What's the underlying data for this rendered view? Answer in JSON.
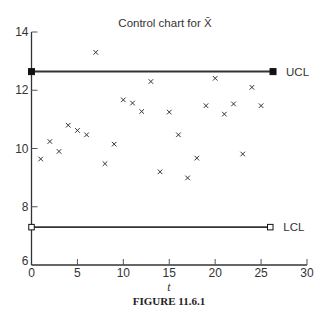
{
  "chart_data": {
    "type": "scatter",
    "title": "Control chart for X̄",
    "xlabel": "t",
    "ylabel": "",
    "caption": "FIGURE 11.6.1",
    "xlim": [
      0,
      30
    ],
    "ylim": [
      6,
      14
    ],
    "xticks": [
      0,
      5,
      10,
      15,
      20,
      25,
      30
    ],
    "yticks": [
      6,
      8,
      10,
      12,
      14
    ],
    "grid": false,
    "legend": null,
    "marker": "x",
    "x": [
      1,
      2,
      3,
      4,
      5,
      6,
      7,
      8,
      9,
      10,
      11,
      12,
      13,
      14,
      15,
      16,
      17,
      18,
      19,
      20,
      21,
      22,
      23,
      24,
      25
    ],
    "values": [
      9.64,
      10.24,
      9.9,
      10.8,
      10.62,
      10.47,
      13.3,
      9.48,
      10.15,
      11.67,
      11.56,
      11.27,
      12.3,
      9.2,
      11.25,
      10.47,
      8.99,
      9.67,
      11.47,
      12.41,
      11.18,
      11.53,
      9.81,
      12.1,
      11.47
    ],
    "control_lines": [
      {
        "name": "UCL",
        "label": "UCL",
        "value": 12.64,
        "x_start": 0,
        "x_end": 26.3,
        "marker": "filled-square"
      },
      {
        "name": "LCL",
        "label": "LCL",
        "value": 7.3,
        "x_start": 0,
        "x_end": 26.0,
        "marker": "open-square"
      }
    ]
  }
}
